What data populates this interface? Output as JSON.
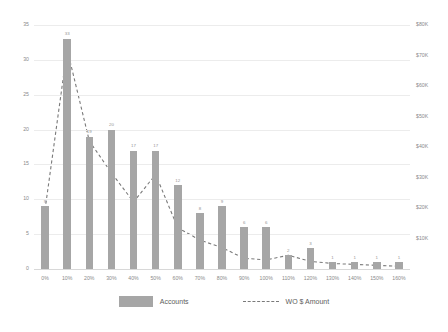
{
  "chart_data": {
    "type": "bar",
    "title": "",
    "subtitle": "",
    "xlabel": "",
    "ylabel": "",
    "grid": true,
    "legend_position": "bottom",
    "categories": [
      "0%",
      "10%",
      "20%",
      "30%",
      "40%",
      "50%",
      "60%",
      "70%",
      "80%",
      "90%",
      "100%",
      "110%",
      "120%",
      "130%",
      "140%",
      "150%",
      "160%"
    ],
    "axes": {
      "left": {
        "label": "Accounts",
        "ylim": [
          0,
          35
        ],
        "ticks": [
          "0",
          "5",
          "10",
          "15",
          "20",
          "25",
          "30",
          "35"
        ],
        "tick_values": [
          0,
          5,
          10,
          15,
          20,
          25,
          30,
          35
        ]
      },
      "right": {
        "label": "WO $ Amount",
        "ylim": [
          0,
          80000
        ],
        "ticks": [
          "$10K",
          "$20K",
          "$30K",
          "$40K",
          "$50K",
          "$60K",
          "$70K",
          "$80K"
        ],
        "tick_values": [
          10000,
          20000,
          30000,
          40000,
          50000,
          60000,
          70000,
          80000
        ]
      }
    },
    "series": [
      {
        "name": "Accounts",
        "type": "bar",
        "axis": "left",
        "color": "#a6a6a6",
        "values": [
          9,
          33,
          19,
          20,
          17,
          17,
          12,
          8,
          9,
          6,
          6,
          2,
          3,
          1,
          1,
          1,
          1
        ],
        "labels": [
          "9",
          "33",
          "19",
          "20",
          "17",
          "17",
          "12",
          "8",
          "9",
          "6",
          "6",
          "2",
          "3",
          "1",
          "1",
          "1",
          "1"
        ]
      },
      {
        "name": "WO $ Amount",
        "type": "line",
        "axis": "right",
        "color": "#7a7a7a",
        "style": "dashed",
        "values": [
          19500,
          72000,
          42000,
          31500,
          22000,
          31000,
          13500,
          9500,
          7000,
          3500,
          3000,
          4500,
          2500,
          1800,
          1500,
          1200,
          900
        ]
      }
    ]
  },
  "legend": {
    "items": [
      {
        "label": "Accounts",
        "marker": "bar-swatch"
      },
      {
        "label": "WO $ Amount",
        "marker": "dashed-line-swatch"
      }
    ]
  }
}
